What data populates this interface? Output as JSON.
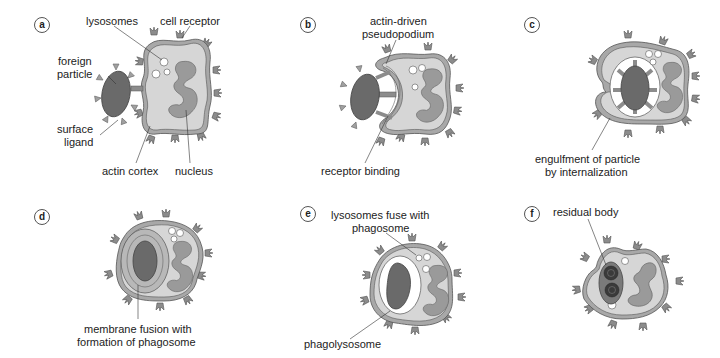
{
  "colors": {
    "cell_fill": "#d6d6d6",
    "cell_outline": "#555555",
    "membrane_band": "#a8a8a8",
    "nucleus": "#9a9a9a",
    "particle": "#6a6a6a",
    "receptor": "#8c8c8c",
    "lysosome": "#ffffff",
    "text": "#222222"
  },
  "panels": [
    {
      "id": "a",
      "badge": "a",
      "labels": {
        "lysosomes": "lysosomes",
        "cell_receptor": "cell receptor",
        "foreign_particle_1": "foreign",
        "foreign_particle_2": "particle",
        "surface_ligand_1": "surface",
        "surface_ligand_2": "ligand",
        "actin_cortex": "actin cortex",
        "nucleus": "nucleus"
      }
    },
    {
      "id": "b",
      "badge": "b",
      "labels": {
        "pseudopodium_1": "actin-driven",
        "pseudopodium_2": "pseudopodium",
        "receptor_binding": "receptor binding"
      }
    },
    {
      "id": "c",
      "badge": "c",
      "labels": {
        "engulfment_1": "engulfment of particle",
        "engulfment_2": "by internalization"
      }
    },
    {
      "id": "d",
      "badge": "d",
      "labels": {
        "fusion_1": "membrane fusion with",
        "fusion_2": "formation of phagosome"
      }
    },
    {
      "id": "e",
      "badge": "e",
      "labels": {
        "lyso_fuse_1": "lysosomes fuse with",
        "lyso_fuse_2": "phagosome",
        "phagolysosome": "phagolysosome"
      }
    },
    {
      "id": "f",
      "badge": "f",
      "labels": {
        "residual_body": "residual body"
      }
    }
  ]
}
